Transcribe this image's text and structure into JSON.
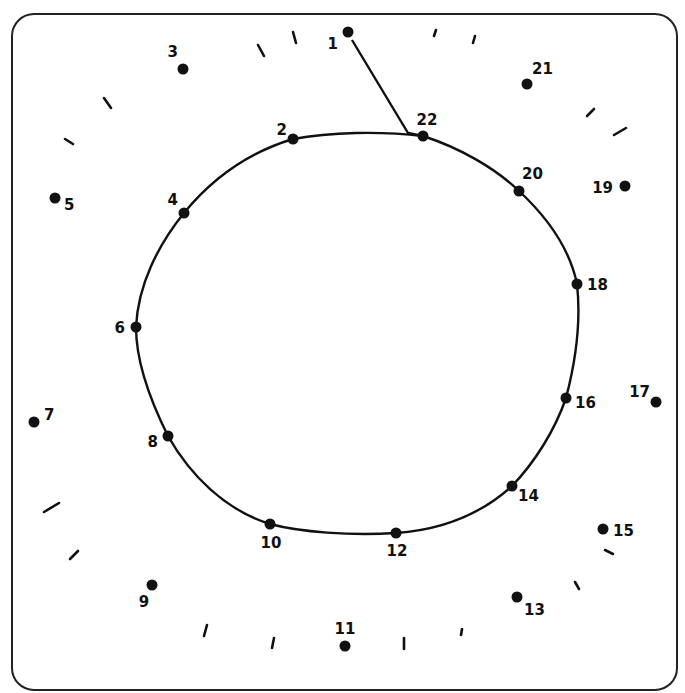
{
  "worksheet": {
    "type": "connect-the-dots",
    "subject": "apple",
    "frame": {
      "x": 12,
      "y": 14,
      "width": 665,
      "height": 676,
      "radius": 22,
      "stroke": "#222222"
    },
    "ink_color": "#111111",
    "background": "#ffffff",
    "dots": [
      {
        "n": "1",
        "x": 348,
        "y": 32,
        "lx": 338,
        "ly": 49,
        "anchor": "end"
      },
      {
        "n": "2",
        "x": 293,
        "y": 139,
        "lx": 287,
        "ly": 135,
        "anchor": "end"
      },
      {
        "n": "3",
        "x": 183,
        "y": 69,
        "lx": 178,
        "ly": 57,
        "anchor": "end"
      },
      {
        "n": "4",
        "x": 184,
        "y": 213,
        "lx": 178,
        "ly": 205,
        "anchor": "end"
      },
      {
        "n": "5",
        "x": 55,
        "y": 198,
        "lx": 64,
        "ly": 210,
        "anchor": "start"
      },
      {
        "n": "6",
        "x": 136,
        "y": 327,
        "lx": 125,
        "ly": 333,
        "anchor": "end"
      },
      {
        "n": "7",
        "x": 34,
        "y": 422,
        "lx": 44,
        "ly": 420,
        "anchor": "start"
      },
      {
        "n": "8",
        "x": 168,
        "y": 436,
        "lx": 158,
        "ly": 447,
        "anchor": "end"
      },
      {
        "n": "9",
        "x": 152,
        "y": 585,
        "lx": 144,
        "ly": 607,
        "anchor": "middle"
      },
      {
        "n": "10",
        "x": 270,
        "y": 524,
        "lx": 271,
        "ly": 548,
        "anchor": "middle"
      },
      {
        "n": "11",
        "x": 345,
        "y": 646,
        "lx": 345,
        "ly": 634,
        "anchor": "middle"
      },
      {
        "n": "12",
        "x": 396,
        "y": 533,
        "lx": 397,
        "ly": 556,
        "anchor": "middle"
      },
      {
        "n": "13",
        "x": 517,
        "y": 597,
        "lx": 524,
        "ly": 615,
        "anchor": "start"
      },
      {
        "n": "14",
        "x": 512,
        "y": 486,
        "lx": 518,
        "ly": 501,
        "anchor": "start"
      },
      {
        "n": "15",
        "x": 603,
        "y": 529,
        "lx": 613,
        "ly": 536,
        "anchor": "start"
      },
      {
        "n": "16",
        "x": 566,
        "y": 398,
        "lx": 575,
        "ly": 408,
        "anchor": "start"
      },
      {
        "n": "17",
        "x": 656,
        "y": 402,
        "lx": 650,
        "ly": 397,
        "anchor": "end"
      },
      {
        "n": "18",
        "x": 577,
        "y": 284,
        "lx": 587,
        "ly": 290,
        "anchor": "start"
      },
      {
        "n": "19",
        "x": 625,
        "y": 186,
        "lx": 613,
        "ly": 193,
        "anchor": "end"
      },
      {
        "n": "20",
        "x": 519,
        "y": 191,
        "lx": 522,
        "ly": 179,
        "anchor": "start"
      },
      {
        "n": "21",
        "x": 527,
        "y": 84,
        "lx": 532,
        "ly": 74,
        "anchor": "start"
      },
      {
        "n": "22",
        "x": 423,
        "y": 136,
        "lx": 427,
        "ly": 125,
        "anchor": "middle"
      }
    ],
    "outline_path": "M 293 139 C 330 132, 380 131, 423 136 C 460 148, 495 168, 519 191 C 548 218, 570 250, 577 284 C 581 320, 576 360, 566 398 C 555 430, 535 462, 512 486 C 480 515, 440 530, 396 533 C 350 536, 300 532, 270 524 C 225 510, 190 475, 168 436 C 150 400, 136 360, 136 327 C 138 285, 158 245, 184 213 C 215 175, 250 152, 293 139",
    "stem_path": "M 352 40 L 408 133 L 423 136",
    "ticks": [
      {
        "x1": 258,
        "y1": 45,
        "x2": 264,
        "y2": 56
      },
      {
        "x1": 293,
        "y1": 32,
        "x2": 296,
        "y2": 43
      },
      {
        "x1": 104,
        "y1": 98,
        "x2": 111,
        "y2": 108
      },
      {
        "x1": 65,
        "y1": 139,
        "x2": 73,
        "y2": 144
      },
      {
        "x1": 436,
        "y1": 30,
        "x2": 434,
        "y2": 36
      },
      {
        "x1": 475,
        "y1": 36,
        "x2": 473,
        "y2": 43
      },
      {
        "x1": 587,
        "y1": 116,
        "x2": 594,
        "y2": 109
      },
      {
        "x1": 614,
        "y1": 135,
        "x2": 626,
        "y2": 128
      },
      {
        "x1": 44,
        "y1": 512,
        "x2": 59,
        "y2": 503
      },
      {
        "x1": 70,
        "y1": 559,
        "x2": 78,
        "y2": 551
      },
      {
        "x1": 204,
        "y1": 636,
        "x2": 207,
        "y2": 625
      },
      {
        "x1": 272,
        "y1": 648,
        "x2": 274,
        "y2": 638
      },
      {
        "x1": 404,
        "y1": 649,
        "x2": 404,
        "y2": 638
      },
      {
        "x1": 462,
        "y1": 629,
        "x2": 461,
        "y2": 635
      },
      {
        "x1": 575,
        "y1": 582,
        "x2": 579,
        "y2": 589
      },
      {
        "x1": 605,
        "y1": 550,
        "x2": 613,
        "y2": 554
      }
    ]
  }
}
